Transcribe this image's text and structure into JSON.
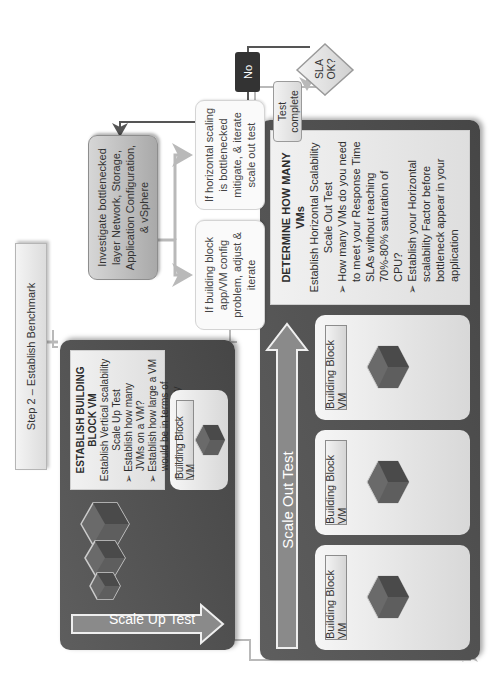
{
  "step_label": "Step 2 – Establish Benchmark",
  "scale_up": {
    "arrow_label": "Scale Up Test",
    "description": {
      "title": "ESTABLISH BUILDING BLOCK VM",
      "subtitle": "Establish Vertical scalability",
      "test_name": "Scale Up Test",
      "bullets": [
        "Establish how many JVMs on a VM?",
        "Establish how large a VM would be in terms of vCPU and memory"
      ]
    },
    "building_block": {
      "label": "Building Block VM"
    },
    "cube_layers": [
      "APP",
      "OS"
    ],
    "stacked_cube_count": 3
  },
  "scale_out": {
    "arrow_label": "Scale Out Test",
    "description": {
      "title": "DETERMINE HOW MANY VMs",
      "subtitle": "Establish Horizontal Scalability",
      "test_name": "Scale Out Test",
      "bullets": [
        "How many VMs do you need to meet your Response Time SLAs without reaching 70%-80% saturation of CPU?",
        "Establish your Horizontal scalability Factor before bottleneck appear in your application"
      ]
    },
    "building_blocks": [
      {
        "label": "Building Block VM"
      },
      {
        "label": "Building Block VM"
      },
      {
        "label": "Building Block VM"
      }
    ],
    "cube_layers": [
      "APP",
      "OS"
    ]
  },
  "decision": {
    "label_line1": "SLA",
    "label_line2": "OK?",
    "no_label": "No",
    "yes_target_line1": "Test",
    "yes_target_line2": "complete"
  },
  "investigate": {
    "text": "Investigate bottlenecked layer Network, Storage, Application Configuration, & vSphere"
  },
  "remediation": {
    "building_block_issue": "If building block app/VM config problem, adjust & iterate",
    "horizontal_issue": "If horizontal scaling is bottlenecked mitigate, & iterate scale out test"
  },
  "colors": {
    "panel_dark": "#4f4f4f",
    "connector": "#b9b9b9",
    "connector_dark": "#555555",
    "badge_dark": "#333333",
    "arrow_fill": "#8a8a8a"
  }
}
